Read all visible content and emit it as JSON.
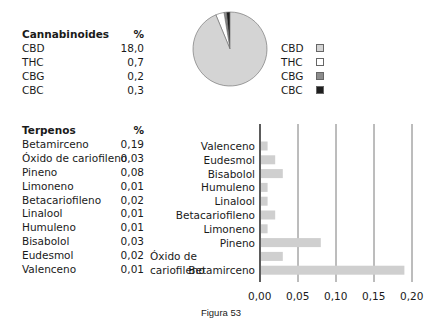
{
  "cannabinoids_table": {
    "header_label": "Cannabinoides",
    "header_unit": "%",
    "rows": [
      {
        "name": "CBD",
        "value": "18,0"
      },
      {
        "name": "THC",
        "value": "0,7"
      },
      {
        "name": "CBG",
        "value": "0,2"
      },
      {
        "name": "CBC",
        "value": "0,3"
      }
    ]
  },
  "terpenes_table": {
    "header_label": "Terpenos",
    "header_unit": "%",
    "rows": [
      {
        "name": "Betamirceno",
        "value": "0,19"
      },
      {
        "name": "Óxido de cariofileno",
        "value": "0,03"
      },
      {
        "name": "Pineno",
        "value": "0,08"
      },
      {
        "name": "Limoneno",
        "value": "0,01"
      },
      {
        "name": "Betacariofileno",
        "value": "0,02"
      },
      {
        "name": "Linalool",
        "value": "0,01"
      },
      {
        "name": "Humuleno",
        "value": "0,01"
      },
      {
        "name": "Bisabolol",
        "value": "0,03"
      },
      {
        "name": "Eudesmol",
        "value": "0,02"
      },
      {
        "name": "Valenceno",
        "value": "0,01"
      }
    ]
  },
  "caption": "Figura 53",
  "colors": {
    "CBD": "#d4d4d4",
    "THC": "#ffffff",
    "CBG": "#8c8c8c",
    "CBC": "#1e1e1e",
    "bar": "#cfcfcf",
    "grid": "#7a7a7a",
    "axis": "#333333"
  },
  "chart_data": [
    {
      "type": "pie",
      "title": "",
      "categories": [
        "CBD",
        "THC",
        "CBG",
        "CBC"
      ],
      "values": [
        18.0,
        0.7,
        0.2,
        0.3
      ],
      "legend": [
        "CBD",
        "THC",
        "CBG",
        "CBC"
      ],
      "legend_position": "right"
    },
    {
      "type": "bar",
      "orientation": "horizontal",
      "title": "",
      "categories": [
        "Valenceno",
        "Eudesmol",
        "Bisabolol",
        "Humuleno",
        "Linalool",
        "Betacariofileno",
        "Limoneno",
        "Pineno",
        "Óxido de cariofileno",
        "Betamirceno"
      ],
      "values": [
        0.01,
        0.02,
        0.03,
        0.01,
        0.01,
        0.02,
        0.01,
        0.08,
        0.03,
        0.19
      ],
      "xlabel": "",
      "ylabel": "",
      "xlim": [
        0,
        0.2
      ],
      "xticks": [
        "0,00",
        "0,05",
        "0,10",
        "0,15",
        "0,20"
      ],
      "grid": "vertical"
    }
  ]
}
